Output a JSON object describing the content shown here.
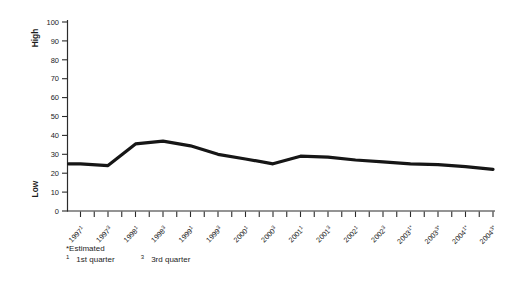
{
  "chart_data": {
    "type": "line",
    "title": "",
    "grid": false,
    "legend": "none",
    "line_color": "#161616",
    "axis_color": "#2b2b2b",
    "text_color": "#1c1c1c",
    "y_axis": {
      "min": 0,
      "max": 100,
      "step": 10,
      "ticks": [
        0,
        10,
        20,
        30,
        40,
        50,
        60,
        70,
        80,
        90,
        100
      ],
      "label_top": "High",
      "label_bottom": "Low"
    },
    "categories": [
      {
        "year": "1997",
        "quarter": "1",
        "estimated": false
      },
      {
        "year": "1997",
        "quarter": "3",
        "estimated": false
      },
      {
        "year": "1998",
        "quarter": "1",
        "estimated": false
      },
      {
        "year": "1998",
        "quarter": "3",
        "estimated": false
      },
      {
        "year": "1999",
        "quarter": "1",
        "estimated": false
      },
      {
        "year": "1999",
        "quarter": "3",
        "estimated": false
      },
      {
        "year": "2000",
        "quarter": "1",
        "estimated": false
      },
      {
        "year": "2000",
        "quarter": "3",
        "estimated": false
      },
      {
        "year": "2001",
        "quarter": "1",
        "estimated": false
      },
      {
        "year": "2001",
        "quarter": "3",
        "estimated": false
      },
      {
        "year": "2002",
        "quarter": "1",
        "estimated": false
      },
      {
        "year": "2002",
        "quarter": "3",
        "estimated": false
      },
      {
        "year": "2003",
        "quarter": "1",
        "estimated": true
      },
      {
        "year": "2003",
        "quarter": "3",
        "estimated": true
      },
      {
        "year": "2004",
        "quarter": "1",
        "estimated": true
      },
      {
        "year": "2004",
        "quarter": "3",
        "estimated": true
      }
    ],
    "values": [
      25,
      24,
      35.5,
      37,
      34.5,
      30,
      27.5,
      25,
      29,
      28.5,
      27,
      26,
      25,
      24.5,
      23.5,
      22
    ]
  },
  "footnote": {
    "estimated": "*Estimated",
    "notes": [
      {
        "sup": "1",
        "text": "1st quarter"
      },
      {
        "sup": "3",
        "text": "3rd quarter"
      }
    ]
  }
}
